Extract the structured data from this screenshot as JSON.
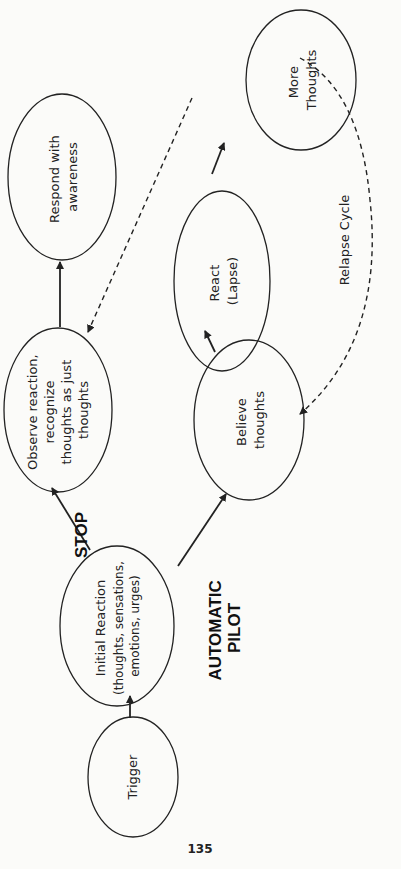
{
  "diagram": {
    "nodes": {
      "trigger": {
        "lines": [
          "Trigger"
        ]
      },
      "initial_reaction": {
        "lines": [
          "Initial Reaction",
          "(thoughts, sensations,",
          "emotions, urges)"
        ]
      },
      "observe": {
        "lines": [
          "Observe reaction,",
          "recognize",
          "thoughts as just",
          "thoughts"
        ]
      },
      "respond": {
        "lines": [
          "Respond with",
          "awareness"
        ]
      },
      "believe": {
        "lines": [
          "Believe",
          "thoughts"
        ]
      },
      "react": {
        "lines": [
          "React",
          "(Lapse)"
        ]
      },
      "more_thoughts": {
        "lines": [
          "More",
          "Thoughts"
        ]
      }
    },
    "labels": {
      "stop": "STOP",
      "automatic_pilot": [
        "AUTOMATIC",
        "PILOT"
      ],
      "relapse_cycle": "Relapse Cycle"
    },
    "edges": [
      {
        "from": "Trigger",
        "to": "Initial Reaction",
        "style": "solid"
      },
      {
        "from": "Initial Reaction",
        "to": "Observe reaction, recognize thoughts as just thoughts",
        "style": "solid",
        "label": "STOP"
      },
      {
        "from": "Observe reaction, recognize thoughts as just thoughts",
        "to": "Respond with awareness",
        "style": "solid"
      },
      {
        "from": "Initial Reaction",
        "to": "Believe thoughts",
        "style": "solid",
        "label": "AUTOMATIC PILOT"
      },
      {
        "from": "Believe thoughts",
        "to": "React (Lapse)",
        "style": "solid"
      },
      {
        "from": "React (Lapse)",
        "to": "More Thoughts",
        "style": "solid"
      },
      {
        "from": "More Thoughts",
        "to": "Observe reaction, recognize thoughts as just thoughts",
        "style": "dashed"
      },
      {
        "from": "More Thoughts",
        "to": "Believe thoughts",
        "style": "dashed",
        "label": "Relapse Cycle"
      }
    ]
  },
  "page": {
    "number": "135"
  }
}
